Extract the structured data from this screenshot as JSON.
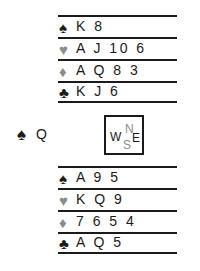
{
  "diagram": {
    "type": "bridge-hand-diagram",
    "colors": {
      "ink": "#1a1a1a",
      "gray_suit": "#8c8c8c",
      "background": "#ffffff"
    },
    "compass": {
      "north_label": "N",
      "south_label": "S",
      "west_label": "W",
      "east_label": "E"
    },
    "suit_glyphs": {
      "spade": "♠",
      "heart": "♥",
      "diamond": "♦",
      "club": "♣"
    },
    "hands": {
      "north": {
        "position_label": "North",
        "suits": [
          {
            "suit": "spade",
            "glyph": "♠",
            "ranks": "K 8"
          },
          {
            "suit": "heart",
            "glyph": "♥",
            "ranks": "A J 10 6"
          },
          {
            "suit": "diamond",
            "glyph": "♦",
            "ranks": "A Q 8 3"
          },
          {
            "suit": "club",
            "glyph": "♣",
            "ranks": "K J 6"
          }
        ]
      },
      "west": {
        "position_label": "West",
        "suits": [
          {
            "suit": "spade",
            "glyph": "♠",
            "ranks": "Q"
          }
        ]
      },
      "south": {
        "position_label": "South",
        "suits": [
          {
            "suit": "spade",
            "glyph": "♠",
            "ranks": "A 9 5"
          },
          {
            "suit": "heart",
            "glyph": "♥",
            "ranks": "K Q 9"
          },
          {
            "suit": "diamond",
            "glyph": "♦",
            "ranks": "7 6 5 4"
          },
          {
            "suit": "club",
            "glyph": "♣",
            "ranks": "A Q 5"
          }
        ]
      }
    }
  }
}
